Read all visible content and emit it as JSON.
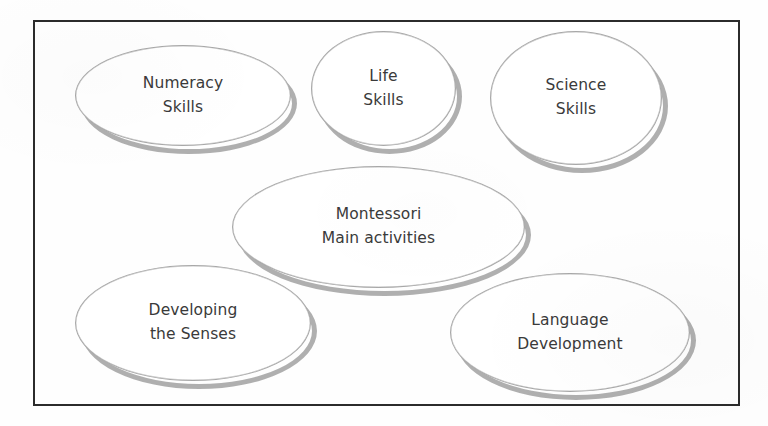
{
  "diagram": {
    "type": "concept-map",
    "title": "Montessori Main activities",
    "frame": {
      "style": "rectangular-border",
      "color": "#2b2b2b"
    },
    "colors": {
      "node_fill": "#ffffff",
      "node_outline": "#a8a8a8",
      "node_shadow": "#9a9a9a",
      "text": "#3a3a3a",
      "frame": "#2b2b2b",
      "background": "#ffffff"
    },
    "nodes": [
      {
        "id": "numeracy",
        "role": "branch",
        "line1": "Numeracy",
        "line2": "Skills"
      },
      {
        "id": "life",
        "role": "branch",
        "line1": "Life",
        "line2": "Skills"
      },
      {
        "id": "science",
        "role": "branch",
        "line1": "Science",
        "line2": "Skills"
      },
      {
        "id": "montessori",
        "role": "center",
        "line1": "Montessori",
        "line2": "Main activities"
      },
      {
        "id": "senses",
        "role": "branch",
        "line1": "Developing",
        "line2": "the Senses"
      },
      {
        "id": "language",
        "role": "branch",
        "line1": "Language",
        "line2": "Development"
      }
    ]
  }
}
